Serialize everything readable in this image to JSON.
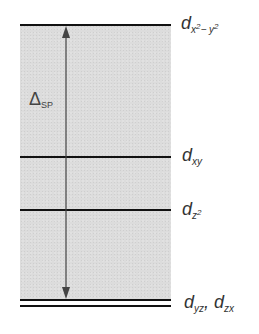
{
  "diagram": {
    "type": "d-orbital energy splitting diagram",
    "splitting_label": {
      "symbol": "Δ",
      "subscript": "SP"
    },
    "levels": [
      {
        "name": "d_x2-y2",
        "base": "d",
        "sub_main": "x",
        "sup1": "2",
        "sub_mid": "− y",
        "sup2": "2",
        "y": 25
      },
      {
        "name": "d_xy",
        "base": "d",
        "sub": "xy",
        "y": 157
      },
      {
        "name": "d_z2",
        "base": "d",
        "sub": "z",
        "sup": "2",
        "y": 210
      },
      {
        "name": "d_yz, d_zx",
        "base1": "d",
        "sub1": "yz",
        "separator": ",",
        "base2": "d",
        "sub2": "zx",
        "y": 300
      }
    ],
    "colors": {
      "line": "#111111",
      "shade": "#dcdcdc",
      "arrow": "#444444",
      "text": "#333333"
    }
  }
}
